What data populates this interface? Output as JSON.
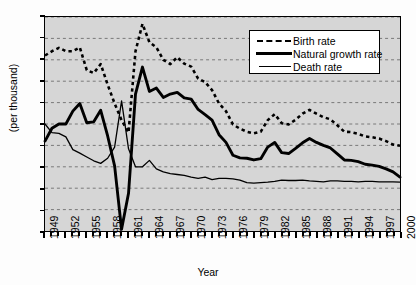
{
  "chart_data": {
    "type": "line",
    "title": "",
    "xlabel": "Year",
    "ylabel": "(per thousand)",
    "ylim": [
      -5,
      45
    ],
    "ytick_step": 5,
    "yticks": [
      45,
      40,
      35,
      30,
      25,
      20,
      15,
      10,
      5,
      0,
      -5
    ],
    "xlim": [
      1949,
      2000
    ],
    "xticks_labeled": [
      1949,
      1952,
      1955,
      1958,
      1961,
      1964,
      1967,
      1970,
      1973,
      1976,
      1979,
      1982,
      1985,
      1988,
      1991,
      1994,
      1997,
      2000
    ],
    "grid": "horizontal-dashed",
    "legend_position": "top-right",
    "x": [
      1949,
      1950,
      1951,
      1952,
      1953,
      1954,
      1955,
      1956,
      1957,
      1958,
      1959,
      1960,
      1961,
      1962,
      1963,
      1964,
      1965,
      1966,
      1967,
      1968,
      1969,
      1970,
      1971,
      1972,
      1973,
      1974,
      1975,
      1976,
      1977,
      1978,
      1979,
      1980,
      1981,
      1982,
      1983,
      1984,
      1985,
      1986,
      1987,
      1988,
      1989,
      1990,
      1991,
      1992,
      1993,
      1994,
      1995,
      1996,
      1997,
      1998,
      1999,
      2000
    ],
    "series": [
      {
        "name": "Birth rate",
        "style": "dashed",
        "values": [
          36.0,
          37.0,
          37.8,
          37.0,
          37.0,
          37.9,
          32.6,
          31.9,
          34.0,
          29.2,
          24.8,
          20.9,
          18.0,
          37.0,
          43.4,
          39.1,
          37.9,
          35.0,
          34.0,
          35.6,
          34.1,
          33.4,
          30.6,
          29.8,
          27.9,
          24.8,
          23.0,
          19.9,
          18.9,
          18.2,
          17.8,
          18.2,
          20.9,
          22.3,
          20.2,
          19.9,
          21.0,
          22.4,
          23.3,
          22.4,
          21.6,
          21.1,
          19.7,
          18.2,
          18.1,
          17.7,
          17.1,
          16.9,
          16.6,
          16.0,
          15.2,
          14.9
        ]
      },
      {
        "name": "Natural growth rate",
        "style": "thick-solid",
        "values": [
          16.0,
          19.0,
          20.0,
          20.0,
          23.0,
          24.8,
          20.3,
          20.5,
          23.2,
          17.2,
          10.2,
          -4.6,
          3.8,
          27.0,
          33.3,
          27.6,
          28.4,
          26.2,
          27.0,
          27.4,
          26.1,
          25.8,
          23.4,
          22.2,
          20.9,
          17.5,
          15.7,
          12.7,
          12.1,
          12.0,
          11.6,
          11.9,
          14.6,
          15.7,
          13.3,
          13.1,
          14.3,
          15.6,
          16.6,
          15.7,
          15.0,
          14.4,
          13.0,
          11.6,
          11.5,
          11.2,
          10.6,
          10.4,
          10.1,
          9.5,
          8.8,
          7.6
        ]
      },
      {
        "name": "Death rate",
        "style": "thin-solid",
        "values": [
          20.0,
          18.0,
          17.8,
          17.0,
          14.0,
          13.2,
          12.3,
          11.4,
          10.8,
          12.0,
          14.6,
          25.4,
          14.2,
          10.0,
          10.0,
          11.5,
          9.5,
          8.8,
          8.4,
          8.2,
          8.0,
          7.6,
          7.3,
          7.6,
          7.0,
          7.3,
          7.3,
          7.2,
          6.9,
          6.3,
          6.2,
          6.3,
          6.4,
          6.6,
          6.9,
          6.8,
          6.8,
          6.9,
          6.7,
          6.6,
          6.5,
          6.7,
          6.7,
          6.6,
          6.6,
          6.5,
          6.6,
          6.6,
          6.5,
          6.5,
          6.5,
          6.4
        ]
      }
    ]
  },
  "legend": {
    "items": [
      {
        "label": "Birth rate",
        "key": "dashed-line-key"
      },
      {
        "label": "Natural growth rate",
        "key": "thick-line-key"
      },
      {
        "label": "Death rate",
        "key": "thin-line-key"
      }
    ]
  },
  "axes": {
    "x_title": "Year",
    "y_title": "(per thousand)"
  }
}
